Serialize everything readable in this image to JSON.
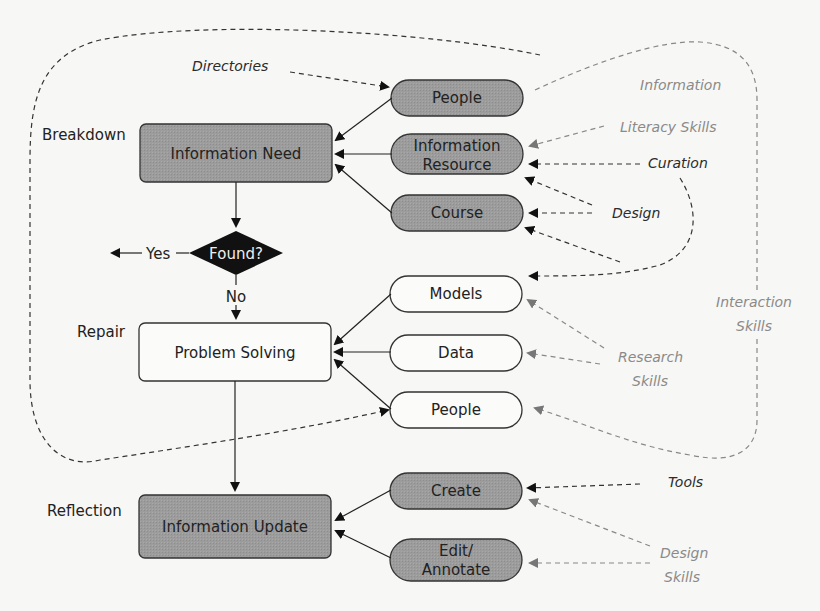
{
  "diagram": {
    "phases": {
      "breakdown": "Breakdown",
      "repair": "Repair",
      "reflection": "Reflection"
    },
    "main_nodes": {
      "information_need": "Information Need",
      "decision": "Found?",
      "yes": "Yes",
      "no": "No",
      "problem_solving": "Problem Solving",
      "information_update": "Information Update"
    },
    "breakdown_sources": {
      "people": "People",
      "information_resource_line1": "Information",
      "information_resource_line2": "Resource",
      "course": "Course"
    },
    "repair_sources": {
      "models": "Models",
      "data": "Data",
      "people": "People"
    },
    "reflection_sources": {
      "create": "Create",
      "edit_line1": "Edit/",
      "edit_line2": "Annotate"
    },
    "annotations": {
      "directories": "Directories",
      "information_literacy_line1": "Information",
      "information_literacy_line2": "Literacy Skills",
      "curation": "Curation",
      "design": "Design",
      "interaction_line1": "Interaction",
      "interaction_line2": "Skills",
      "research_line1": "Research",
      "research_line2": "Skills",
      "tools": "Tools",
      "design_skills_line1": "Design",
      "design_skills_line2": "Skills"
    },
    "colors": {
      "filled_node": "#9a9a9a",
      "outline": "#333333",
      "decision": "#111111",
      "grey_annotation": "#8a8a8a",
      "dark_annotation": "#2b2b2b"
    }
  }
}
